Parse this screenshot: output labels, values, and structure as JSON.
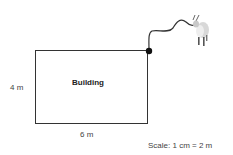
{
  "diagram": {
    "building_label": "Building",
    "height_label": "4 m",
    "width_label": "6 m",
    "scale_label": "Scale: 1 cm = 2 m",
    "icons": [
      "tether-post-icon",
      "rope-icon",
      "goat-icon"
    ]
  }
}
